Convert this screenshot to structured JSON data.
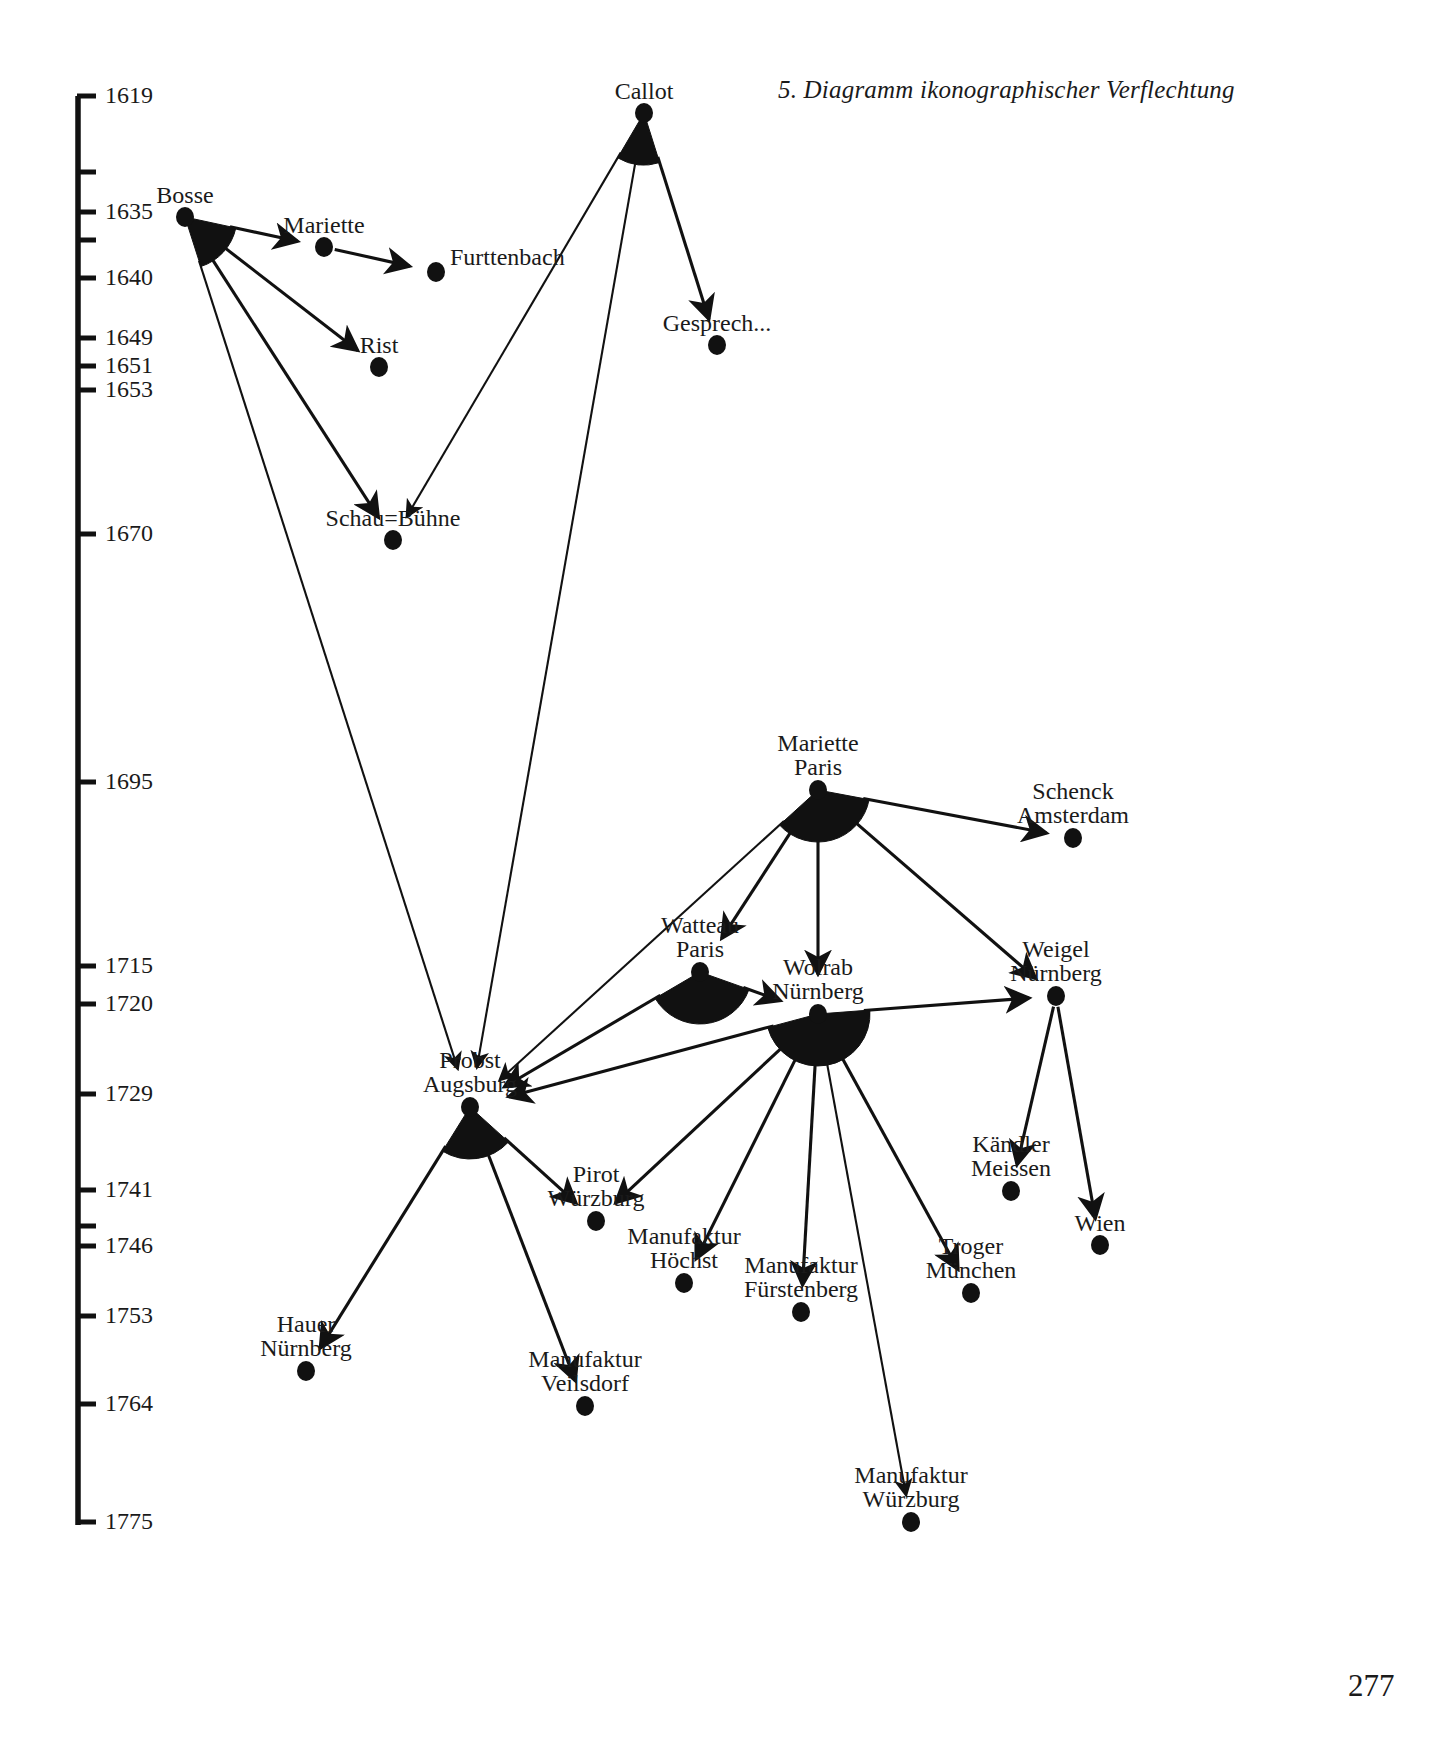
{
  "figure": {
    "title": "5. Diagramm ikonographischer Verflechtung",
    "page_number": "277"
  },
  "axis": {
    "name": "year-timeline",
    "orientation": "vertical",
    "x": 78,
    "top": 96,
    "bottom": 1525,
    "ticks": [
      {
        "label": "1619",
        "y": 96,
        "labeled": true
      },
      {
        "label": "",
        "y": 172,
        "labeled": false
      },
      {
        "label": "1635",
        "y": 212,
        "labeled": true
      },
      {
        "label": "",
        "y": 240,
        "labeled": false
      },
      {
        "label": "1640",
        "y": 278,
        "labeled": true
      },
      {
        "label": "1649",
        "y": 338,
        "labeled": true
      },
      {
        "label": "1651",
        "y": 366,
        "labeled": true
      },
      {
        "label": "1653",
        "y": 390,
        "labeled": true
      },
      {
        "label": "1670",
        "y": 534,
        "labeled": true
      },
      {
        "label": "1695",
        "y": 782,
        "labeled": true
      },
      {
        "label": "1715",
        "y": 966,
        "labeled": true
      },
      {
        "label": "1720",
        "y": 1004,
        "labeled": true
      },
      {
        "label": "1729",
        "y": 1094,
        "labeled": true
      },
      {
        "label": "1741",
        "y": 1190,
        "labeled": true
      },
      {
        "label": "",
        "y": 1226,
        "labeled": false
      },
      {
        "label": "1746",
        "y": 1246,
        "labeled": true
      },
      {
        "label": "1753",
        "y": 1316,
        "labeled": true
      },
      {
        "label": "1764",
        "y": 1404,
        "labeled": true
      },
      {
        "label": "1775",
        "y": 1522,
        "labeled": true
      }
    ]
  },
  "chart_data": {
    "type": "network-timeline",
    "title": "5. Diagramm ikonographischer Verflechtung",
    "ylabel": "Jahr",
    "ylim": [
      1619,
      1775
    ],
    "grid": false,
    "legend": "none",
    "nodes": [
      {
        "id": "callot",
        "label": "Callot",
        "lines": [
          "Callot"
        ],
        "x": 644,
        "y": 113,
        "year": 1619,
        "fan": true,
        "out_degree": 3,
        "label_pos": "above"
      },
      {
        "id": "bosse",
        "label": "Bosse",
        "lines": [
          "Bosse"
        ],
        "x": 185,
        "y": 217,
        "year": 1635,
        "fan": true,
        "out_degree": 4,
        "label_pos": "above"
      },
      {
        "id": "mariette",
        "label": "Mariette",
        "lines": [
          "Mariette"
        ],
        "x": 324,
        "y": 247,
        "year": 1637,
        "fan": false,
        "out_degree": 1,
        "label_pos": "above"
      },
      {
        "id": "furttenbach",
        "label": "Furttenbach",
        "lines": [
          "Furttenbach"
        ],
        "x": 436,
        "y": 272,
        "year": 1640,
        "fan": false,
        "out_degree": 0,
        "label_pos": "above-right"
      },
      {
        "id": "gesprech",
        "label": "Gesprech...",
        "lines": [
          "Gesprech..."
        ],
        "x": 717,
        "y": 345,
        "year": 1644,
        "fan": false,
        "out_degree": 0,
        "label_pos": "above"
      },
      {
        "id": "rist",
        "label": "Rist",
        "lines": [
          "Rist"
        ],
        "x": 379,
        "y": 367,
        "year": 1651,
        "fan": false,
        "out_degree": 0,
        "label_pos": "above"
      },
      {
        "id": "schaubuehne",
        "label": "Schau=Bühne",
        "lines": [
          "Schau=Bühne"
        ],
        "x": 393,
        "y": 540,
        "year": 1670,
        "fan": false,
        "out_degree": 0,
        "label_pos": "above"
      },
      {
        "id": "mariette_paris",
        "label": "Mariette Paris",
        "lines": [
          "Mariette",
          "Paris"
        ],
        "x": 818,
        "y": 790,
        "year": 1695,
        "fan": true,
        "out_degree": 5,
        "label_pos": "above"
      },
      {
        "id": "schenck_amsterdam",
        "label": "Schenck Amsterdam",
        "lines": [
          "Schenck",
          "Amsterdam"
        ],
        "x": 1073,
        "y": 838,
        "year": 1702,
        "fan": false,
        "out_degree": 0,
        "label_pos": "above"
      },
      {
        "id": "watteau_paris",
        "label": "Watteau Paris",
        "lines": [
          "Watteau",
          "Paris"
        ],
        "x": 700,
        "y": 972,
        "year": 1715,
        "fan": true,
        "out_degree": 2,
        "label_pos": "above"
      },
      {
        "id": "weigel_nuernberg",
        "label": "Weigel Nürnberg",
        "lines": [
          "Weigel",
          "Nürnberg"
        ],
        "x": 1056,
        "y": 996,
        "year": 1719,
        "fan": false,
        "out_degree": 2,
        "label_pos": "above"
      },
      {
        "id": "wolrab_nuernberg",
        "label": "Wolrab Nürnberg",
        "lines": [
          "Wolrab",
          "Nürnberg"
        ],
        "x": 818,
        "y": 1014,
        "year": 1720,
        "fan": true,
        "out_degree": 7,
        "label_pos": "above"
      },
      {
        "id": "probst_augsburg",
        "label": "Probst Augsburg",
        "lines": [
          "Probst",
          "Augsburg"
        ],
        "x": 470,
        "y": 1107,
        "year": 1729,
        "fan": true,
        "out_degree": 3,
        "label_pos": "above"
      },
      {
        "id": "kaendler_meissen",
        "label": "Kändler Meissen",
        "lines": [
          "Kändler",
          "Meissen"
        ],
        "x": 1011,
        "y": 1191,
        "year": 1741,
        "fan": false,
        "out_degree": 0,
        "label_pos": "above"
      },
      {
        "id": "pirot_wuerzburg",
        "label": "Pirot Würzburg",
        "lines": [
          "Pirot",
          "Würzburg"
        ],
        "x": 596,
        "y": 1221,
        "year": 1743,
        "fan": false,
        "out_degree": 0,
        "label_pos": "above"
      },
      {
        "id": "wien",
        "label": "Wien",
        "lines": [
          "Wien"
        ],
        "x": 1100,
        "y": 1245,
        "year": 1746,
        "fan": false,
        "out_degree": 0,
        "label_pos": "above"
      },
      {
        "id": "manufaktur_hoechst",
        "label": "Manufaktur Höchst",
        "lines": [
          "Manufaktur",
          "Höchst"
        ],
        "x": 684,
        "y": 1283,
        "year": 1750,
        "fan": false,
        "out_degree": 0,
        "label_pos": "above"
      },
      {
        "id": "troger_muenchen",
        "label": "Troger München",
        "lines": [
          "Troger",
          "München"
        ],
        "x": 971,
        "y": 1293,
        "year": 1751,
        "fan": false,
        "out_degree": 0,
        "label_pos": "above"
      },
      {
        "id": "manufaktur_fuerstenberg",
        "label": "Manufaktur Fürstenberg",
        "lines": [
          "Manufaktur",
          "Fürstenberg"
        ],
        "x": 801,
        "y": 1312,
        "year": 1753,
        "fan": false,
        "out_degree": 0,
        "label_pos": "above"
      },
      {
        "id": "hauer_nuernberg",
        "label": "Hauer Nürnberg",
        "lines": [
          "Hauer",
          "Nürnberg"
        ],
        "x": 306,
        "y": 1371,
        "year": 1757,
        "fan": false,
        "out_degree": 0,
        "label_pos": "above"
      },
      {
        "id": "manufaktur_veilsdorf",
        "label": "Manufaktur Veilsdorf",
        "lines": [
          "Manufaktur",
          "Veilsdorf"
        ],
        "x": 585,
        "y": 1406,
        "year": 1764,
        "fan": false,
        "out_degree": 0,
        "label_pos": "above"
      },
      {
        "id": "manufaktur_wuerzburg",
        "label": "Manufaktur Würzburg",
        "lines": [
          "Manufaktur",
          "Würzburg"
        ],
        "x": 911,
        "y": 1522,
        "year": 1775,
        "fan": false,
        "out_degree": 0,
        "label_pos": "above"
      }
    ],
    "edges": [
      {
        "from": "bosse",
        "to": "mariette"
      },
      {
        "from": "mariette",
        "to": "furttenbach"
      },
      {
        "from": "bosse",
        "to": "rist"
      },
      {
        "from": "bosse",
        "to": "schaubuehne"
      },
      {
        "from": "bosse",
        "to": "probst_augsburg"
      },
      {
        "from": "callot",
        "to": "gesprech"
      },
      {
        "from": "callot",
        "to": "schaubuehne"
      },
      {
        "from": "callot",
        "to": "probst_augsburg"
      },
      {
        "from": "mariette_paris",
        "to": "schenck_amsterdam"
      },
      {
        "from": "mariette_paris",
        "to": "watteau_paris"
      },
      {
        "from": "mariette_paris",
        "to": "wolrab_nuernberg"
      },
      {
        "from": "mariette_paris",
        "to": "weigel_nuernberg"
      },
      {
        "from": "mariette_paris",
        "to": "probst_augsburg"
      },
      {
        "from": "watteau_paris",
        "to": "wolrab_nuernberg"
      },
      {
        "from": "watteau_paris",
        "to": "probst_augsburg"
      },
      {
        "from": "wolrab_nuernberg",
        "to": "weigel_nuernberg"
      },
      {
        "from": "wolrab_nuernberg",
        "to": "probst_augsburg"
      },
      {
        "from": "wolrab_nuernberg",
        "to": "pirot_wuerzburg"
      },
      {
        "from": "wolrab_nuernberg",
        "to": "manufaktur_hoechst"
      },
      {
        "from": "wolrab_nuernberg",
        "to": "manufaktur_fuerstenberg"
      },
      {
        "from": "wolrab_nuernberg",
        "to": "troger_muenchen"
      },
      {
        "from": "wolrab_nuernberg",
        "to": "manufaktur_wuerzburg"
      },
      {
        "from": "weigel_nuernberg",
        "to": "kaendler_meissen"
      },
      {
        "from": "weigel_nuernberg",
        "to": "wien"
      },
      {
        "from": "probst_augsburg",
        "to": "hauer_nuernberg"
      },
      {
        "from": "probst_augsburg",
        "to": "pirot_wuerzburg"
      },
      {
        "from": "probst_augsburg",
        "to": "manufaktur_veilsdorf"
      }
    ]
  }
}
